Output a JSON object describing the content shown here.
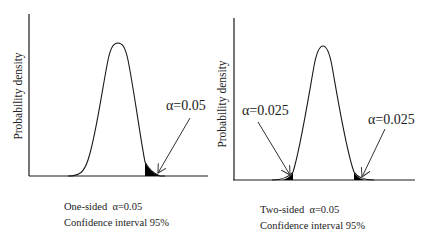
{
  "figure": {
    "panels": [
      {
        "id": "one-sided",
        "ylabel": "Probability density",
        "alpha_labels": [
          "α=0.05"
        ],
        "caption_line1": "One-sided  α=0.05",
        "caption_line2": "Confidence interval 95%"
      },
      {
        "id": "two-sided",
        "ylabel": "Probability density",
        "alpha_labels": [
          "α=0.025",
          "α=0.025"
        ],
        "caption_line1": "Two-sided  α=0.05",
        "caption_line2": "Confidence interval 95%"
      }
    ],
    "colors": {
      "line": "#1a1a1a",
      "fill": "#000000",
      "background": "#ffffff"
    }
  }
}
